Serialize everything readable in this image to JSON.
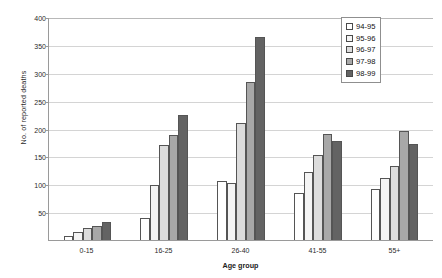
{
  "chart_data": {
    "type": "bar",
    "title": "",
    "xlabel": "Age group",
    "ylabel": "No. of reported deaths",
    "categories": [
      "0-15",
      "16-25",
      "26-40",
      "41-55",
      "55+"
    ],
    "ylim": [
      0,
      400
    ],
    "yticks": [
      0,
      50,
      100,
      150,
      200,
      250,
      300,
      350,
      400
    ],
    "ytick_labels": [
      "0",
      "50",
      "100",
      "150",
      "200",
      "250",
      "300",
      "350",
      "400"
    ],
    "grid": true,
    "legend_position": "top-right",
    "series": [
      {
        "name": "94-95",
        "color": "#ffffff",
        "values": [
          8,
          40,
          105,
          85,
          92
        ]
      },
      {
        "name": "95-96",
        "color": "#f4f4f4",
        "values": [
          15,
          98,
          103,
          122,
          112
        ]
      },
      {
        "name": "96-97",
        "color": "#dcdcdc",
        "values": [
          22,
          170,
          210,
          153,
          133
        ]
      },
      {
        "name": "97-98",
        "color": "#a8a8a8",
        "values": [
          25,
          188,
          283,
          190,
          195
        ]
      },
      {
        "name": "98-99",
        "color": "#636363",
        "values": [
          32,
          225,
          365,
          178,
          173
        ]
      }
    ]
  },
  "axis": {
    "y_title": "No. of reported deaths",
    "x_title": "Age group"
  }
}
